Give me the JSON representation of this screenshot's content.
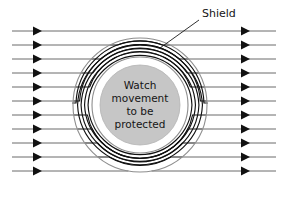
{
  "figure": {
    "background_color": "#ffffff"
  },
  "labels": {
    "shield": "Shield",
    "core_lines": [
      "Watch",
      "movement",
      "to be",
      "protected"
    ],
    "core_text_full": "Watch movement to be protected"
  },
  "colors": {
    "core_fill": "#c6c6c6",
    "shell_stroke": "#8e8e8e",
    "fieldline_light": "#5a5a5a",
    "fieldline_dark": "#111111",
    "text": "#151515",
    "background": "#ffffff"
  },
  "geometry": {
    "center_x": 140,
    "center_y": 105,
    "shell_outer_radius": 67,
    "shell_inner_radius": 48,
    "core_radius": 40,
    "field_line_count": 11,
    "field_line_y": [
      31,
      45,
      59,
      73,
      87,
      101,
      115,
      129,
      143,
      157,
      171
    ],
    "left_margin_x": 12,
    "right_margin_x": 276,
    "left_arrow_x": 42,
    "right_arrow_x": 250
  },
  "leader": {
    "from_x": 199,
    "from_y": 20,
    "to_x": 160,
    "to_y": 48
  },
  "shield_label_position": {
    "x": 202,
    "y": 17
  }
}
